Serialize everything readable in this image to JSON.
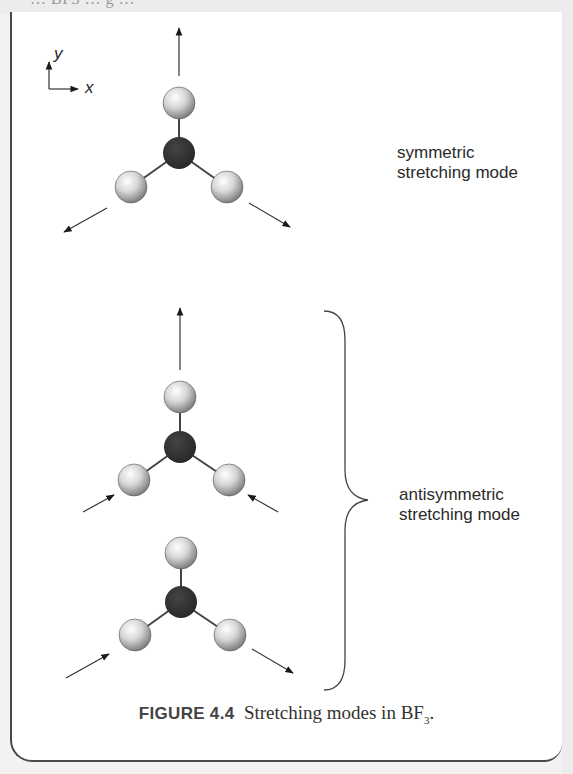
{
  "page": {
    "top_cut_text": "… BF3 … g …"
  },
  "axes": {
    "x_label": "x",
    "y_label": "y"
  },
  "modes": [
    {
      "label_line1": "symmetric",
      "label_line2": "stretching mode"
    },
    {
      "label_line1": "antisymmetric",
      "label_line2": "stretching mode"
    }
  ],
  "caption": {
    "figure_number": "FIGURE 4.4",
    "text": "Stretching modes in BF",
    "subscript": "3",
    "end": "."
  },
  "molecules": [
    {
      "name": "symmetric",
      "center_atom": "B",
      "outer_atoms": "F",
      "arrows": [
        "up-outward",
        "left-down-outward",
        "right-down-outward"
      ]
    },
    {
      "name": "antisymmetric-a",
      "center_atom": "B",
      "outer_atoms": "F",
      "arrows": [
        "up-outward",
        "left-inward",
        "right-inward"
      ]
    },
    {
      "name": "antisymmetric-b",
      "center_atom": "B",
      "outer_atoms": "F",
      "arrows": [
        "left-inward",
        "right-outward"
      ]
    }
  ],
  "colors": {
    "boron": "#2e2e2e",
    "fluorine_light": "#f4f4f4",
    "fluorine_dark": "#7a7a7a",
    "line": "#333333"
  }
}
